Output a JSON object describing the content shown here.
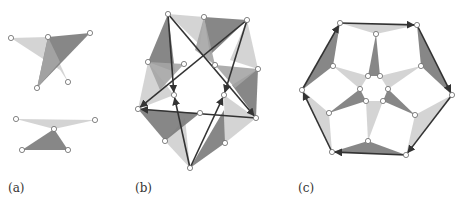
{
  "colors": {
    "dark": "#7a7a7a",
    "mid": "#a5a5a5",
    "light": "#cfcfcf",
    "edge": "#333333",
    "node_fill": "#ffffff",
    "node_stroke": "#666666"
  },
  "panels": [
    {
      "id": "a",
      "label": "(a)",
      "label_pos": [
        8,
        193
      ]
    },
    {
      "id": "b",
      "label": "(b)",
      "label_pos": [
        135,
        193
      ]
    },
    {
      "id": "c",
      "label": "(c)",
      "label_pos": [
        298,
        193
      ]
    }
  ],
  "figure_a": {
    "triangles": [
      {
        "pts": [
          [
            11,
            38
          ],
          [
            48,
            37
          ],
          [
            60,
            70
          ]
        ],
        "shade": "light"
      },
      {
        "pts": [
          [
            48,
            37
          ],
          [
            68,
            82
          ],
          [
            55,
            62
          ]
        ],
        "shade": "light"
      },
      {
        "pts": [
          [
            48,
            37
          ],
          [
            90,
            33
          ],
          [
            37,
            88
          ]
        ],
        "shade": "dark"
      },
      {
        "pts": [
          [
            48,
            37
          ],
          [
            60,
            62
          ],
          [
            37,
            88
          ]
        ],
        "shade": "mid"
      },
      {
        "pts": [
          [
            16,
            119
          ],
          [
            95,
            120
          ],
          [
            54,
            129
          ]
        ],
        "shade": "light"
      },
      {
        "pts": [
          [
            22,
            150
          ],
          [
            54,
            129
          ],
          [
            68,
            150
          ]
        ],
        "shade": "dark"
      }
    ],
    "nodes": [
      [
        11,
        38
      ],
      [
        48,
        37
      ],
      [
        90,
        33
      ],
      [
        37,
        88
      ],
      [
        68,
        82
      ],
      [
        16,
        119
      ],
      [
        95,
        120
      ],
      [
        54,
        129
      ],
      [
        22,
        150
      ],
      [
        68,
        150
      ]
    ]
  },
  "figure_b": {
    "outer_nodes": [
      [
        168,
        14
      ],
      [
        204,
        17
      ],
      [
        247,
        20
      ],
      [
        258,
        69
      ],
      [
        256,
        118
      ],
      [
        225,
        143
      ],
      [
        190,
        168
      ],
      [
        165,
        141
      ],
      [
        138,
        109
      ],
      [
        148,
        62
      ]
    ],
    "inner_nodes": [
      [
        184,
        64
      ],
      [
        215,
        65
      ],
      [
        174,
        95
      ],
      [
        224,
        95
      ],
      [
        200,
        113
      ]
    ],
    "triangles": [
      {
        "pts": [
          [
            168,
            14
          ],
          [
            148,
            62
          ],
          [
            175,
            72
          ]
        ],
        "shade": "dark"
      },
      {
        "pts": [
          [
            168,
            14
          ],
          [
            204,
            17
          ],
          [
            200,
            45
          ]
        ],
        "shade": "light"
      },
      {
        "pts": [
          [
            204,
            17
          ],
          [
            247,
            20
          ],
          [
            210,
            55
          ]
        ],
        "shade": "dark"
      },
      {
        "pts": [
          [
            204,
            17
          ],
          [
            195,
            50
          ],
          [
            215,
            65
          ]
        ],
        "shade": "mid"
      },
      {
        "pts": [
          [
            247,
            20
          ],
          [
            258,
            69
          ],
          [
            230,
            60
          ]
        ],
        "shade": "light"
      },
      {
        "pts": [
          [
            258,
            69
          ],
          [
            256,
            118
          ],
          [
            232,
            85
          ]
        ],
        "shade": "dark"
      },
      {
        "pts": [
          [
            215,
            65
          ],
          [
            258,
            69
          ],
          [
            235,
            88
          ]
        ],
        "shade": "mid"
      },
      {
        "pts": [
          [
            256,
            118
          ],
          [
            225,
            143
          ],
          [
            224,
            95
          ]
        ],
        "shade": "light"
      },
      {
        "pts": [
          [
            225,
            143
          ],
          [
            190,
            168
          ],
          [
            224,
            110
          ]
        ],
        "shade": "dark"
      },
      {
        "pts": [
          [
            190,
            168
          ],
          [
            165,
            141
          ],
          [
            185,
            118
          ]
        ],
        "shade": "light"
      },
      {
        "pts": [
          [
            165,
            141
          ],
          [
            138,
            109
          ],
          [
            200,
            113
          ]
        ],
        "shade": "dark"
      },
      {
        "pts": [
          [
            138,
            109
          ],
          [
            148,
            62
          ],
          [
            174,
            95
          ]
        ],
        "shade": "light"
      },
      {
        "pts": [
          [
            148,
            62
          ],
          [
            184,
            64
          ],
          [
            160,
            90
          ]
        ],
        "shade": "mid"
      }
    ],
    "edges": [
      [
        [
          168,
          14
        ],
        [
          256,
          118
        ]
      ],
      [
        [
          168,
          14
        ],
        [
          174,
          95
        ]
      ],
      [
        [
          247,
          20
        ],
        [
          138,
          109
        ]
      ],
      [
        [
          247,
          20
        ],
        [
          224,
          95
        ]
      ],
      [
        [
          256,
          118
        ],
        [
          138,
          109
        ]
      ],
      [
        [
          190,
          168
        ],
        [
          174,
          95
        ]
      ],
      [
        [
          190,
          168
        ],
        [
          224,
          95
        ]
      ]
    ]
  },
  "figure_c": {
    "hex_nodes": [
      [
        340,
        23
      ],
      [
        417,
        25
      ],
      [
        452,
        95
      ],
      [
        406,
        155
      ],
      [
        332,
        152
      ],
      [
        302,
        90
      ]
    ],
    "mid_nodes": [
      [
        376,
        34
      ],
      [
        421,
        66
      ],
      [
        415,
        115
      ],
      [
        368,
        141
      ],
      [
        329,
        113
      ],
      [
        333,
        66
      ]
    ],
    "inner_nodes": [
      [
        368,
        76
      ],
      [
        380,
        76
      ],
      [
        360,
        89
      ],
      [
        388,
        89
      ],
      [
        366,
        101
      ],
      [
        383,
        101
      ]
    ],
    "triangles": [
      {
        "pts": [
          [
            340,
            23
          ],
          [
            417,
            25
          ],
          [
            376,
            34
          ]
        ],
        "shade": "light"
      },
      {
        "pts": [
          [
            376,
            34
          ],
          [
            368,
            76
          ],
          [
            380,
            76
          ]
        ],
        "shade": "dark"
      },
      {
        "pts": [
          [
            417,
            25
          ],
          [
            452,
            95
          ],
          [
            421,
            66
          ]
        ],
        "shade": "dark"
      },
      {
        "pts": [
          [
            421,
            66
          ],
          [
            388,
            89
          ],
          [
            380,
            76
          ]
        ],
        "shade": "light"
      },
      {
        "pts": [
          [
            452,
            95
          ],
          [
            406,
            155
          ],
          [
            415,
            115
          ]
        ],
        "shade": "light"
      },
      {
        "pts": [
          [
            415,
            115
          ],
          [
            388,
            89
          ],
          [
            383,
            101
          ]
        ],
        "shade": "dark"
      },
      {
        "pts": [
          [
            406,
            155
          ],
          [
            332,
            152
          ],
          [
            368,
            141
          ]
        ],
        "shade": "dark"
      },
      {
        "pts": [
          [
            368,
            141
          ],
          [
            366,
            101
          ],
          [
            383,
            101
          ]
        ],
        "shade": "light"
      },
      {
        "pts": [
          [
            332,
            152
          ],
          [
            302,
            90
          ],
          [
            329,
            113
          ]
        ],
        "shade": "light"
      },
      {
        "pts": [
          [
            329,
            113
          ],
          [
            360,
            89
          ],
          [
            366,
            101
          ]
        ],
        "shade": "dark"
      },
      {
        "pts": [
          [
            302,
            90
          ],
          [
            340,
            23
          ],
          [
            333,
            66
          ]
        ],
        "shade": "dark"
      },
      {
        "pts": [
          [
            333,
            66
          ],
          [
            368,
            76
          ],
          [
            360,
            89
          ]
        ],
        "shade": "light"
      }
    ],
    "edges": [
      [
        [
          302,
          90
        ],
        [
          340,
          23
        ]
      ],
      [
        [
          340,
          23
        ],
        [
          417,
          25
        ]
      ],
      [
        [
          417,
          25
        ],
        [
          452,
          95
        ]
      ],
      [
        [
          452,
          95
        ],
        [
          406,
          155
        ]
      ],
      [
        [
          406,
          155
        ],
        [
          332,
          152
        ]
      ],
      [
        [
          332,
          152
        ],
        [
          302,
          90
        ]
      ]
    ]
  }
}
